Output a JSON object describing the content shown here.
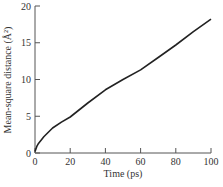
{
  "chart_data": {
    "type": "line",
    "title": "",
    "xlabel": "Time (ps)",
    "ylabel": "Mean-square distance (Å²)",
    "xlim": [
      0,
      100
    ],
    "ylim": [
      0,
      20
    ],
    "x_ticks": [
      0,
      20,
      40,
      60,
      80,
      100
    ],
    "y_ticks": [
      0,
      5,
      10,
      15,
      20
    ],
    "grid": false,
    "legend": null,
    "series": [
      {
        "name": "MSD",
        "color": "#222222",
        "x": [
          0,
          1,
          2,
          5,
          10,
          15,
          20,
          30,
          40,
          50,
          60,
          70,
          80,
          90,
          100
        ],
        "y": [
          0.2,
          0.9,
          1.3,
          2.2,
          3.4,
          4.2,
          4.9,
          6.8,
          8.6,
          10.0,
          11.3,
          13.0,
          14.7,
          16.5,
          18.2
        ]
      }
    ]
  }
}
